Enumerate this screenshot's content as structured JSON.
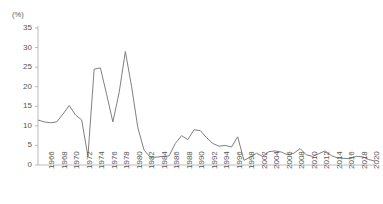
{
  "chart_data": {
    "type": "line",
    "title": "",
    "xlabel": "",
    "ylabel": "(%)",
    "ylim": [
      0,
      35
    ],
    "ytick_values": [
      0,
      5,
      10,
      15,
      20,
      25,
      30,
      35
    ],
    "ytick_labels": [
      "0",
      "5",
      "10",
      "15",
      "20",
      "25",
      "30",
      "35"
    ],
    "xlim": [
      1966,
      2020
    ],
    "xtick_labels": [
      "1966",
      "1968",
      "1970",
      "1972",
      "1974",
      "1976",
      "1978",
      "1980",
      "1982",
      "1984",
      "1986",
      "1988",
      "1990",
      "1992",
      "1994",
      "1996",
      "1998",
      "2002",
      "2004",
      "2006",
      "2008",
      "2010",
      "2012",
      "2014",
      "2016",
      "2018",
      "2020"
    ],
    "grid": false,
    "legend": false,
    "line_color": "#808080",
    "axis_color": "#aaaaaa",
    "x": [
      1966,
      1967,
      1968,
      1969,
      1970,
      1971,
      1972,
      1973,
      1974,
      1975,
      1976,
      1977,
      1978,
      1979,
      1980,
      1981,
      1982,
      1983,
      1984,
      1985,
      1986,
      1987,
      1988,
      1989,
      1990,
      1991,
      1992,
      1993,
      1994,
      1995,
      1996,
      1997,
      1998,
      1999,
      2000,
      2001,
      2002,
      2003,
      2004,
      2005,
      2006,
      2007,
      2008,
      2009,
      2010,
      2011,
      2012,
      2013,
      2014,
      2015,
      2016,
      2017,
      2018,
      2019,
      2020
    ],
    "values": [
      11.5,
      11.0,
      10.8,
      11.0,
      13.0,
      15.2,
      12.8,
      11.5,
      2.2,
      24.5,
      24.8,
      18.0,
      11.0,
      18.5,
      29.0,
      20.0,
      9.5,
      3.8,
      2.0,
      2.0,
      2.2,
      2.3,
      5.5,
      7.5,
      6.5,
      9.0,
      8.8,
      7.0,
      5.5,
      4.8,
      5.0,
      4.6,
      7.2,
      1.2,
      2.0,
      3.0,
      2.2,
      3.4,
      3.6,
      3.3,
      2.6,
      3.0,
      4.2,
      2.6,
      2.2,
      2.9,
      3.6,
      2.4,
      1.8,
      1.7,
      1.6,
      2.2,
      2.1,
      1.4,
      1.0
    ]
  }
}
